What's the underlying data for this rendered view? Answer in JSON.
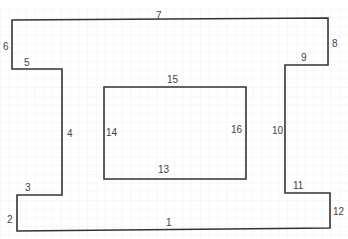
{
  "diagram": {
    "type": "floor-plan-outline",
    "outer_shape": {
      "description": "I-beam shaped outline with 12 numbered edges",
      "points": [
        [
          12,
          20
        ],
        [
          328,
          18
        ],
        [
          328,
          65
        ],
        [
          285,
          65
        ],
        [
          285,
          193
        ],
        [
          330,
          193
        ],
        [
          330,
          228
        ],
        [
          17,
          231
        ],
        [
          17,
          195
        ],
        [
          62,
          195
        ],
        [
          62,
          69
        ],
        [
          12,
          69
        ]
      ]
    },
    "inner_shape": {
      "description": "Rectangle with 4 numbered edges",
      "points": [
        [
          104,
          87
        ],
        [
          246,
          87
        ],
        [
          246,
          179
        ],
        [
          104,
          179
        ]
      ]
    },
    "line_color": "#333333",
    "grid_color": "#e4e4e4",
    "labels": [
      {
        "text": "1",
        "x": 166,
        "y": 218
      },
      {
        "text": "2",
        "x": 7,
        "y": 215
      },
      {
        "text": "3",
        "x": 25,
        "y": 183
      },
      {
        "text": "4",
        "x": 67,
        "y": 129
      },
      {
        "text": "5",
        "x": 24,
        "y": 58
      },
      {
        "text": "6",
        "x": 3,
        "y": 42
      },
      {
        "text": "7",
        "x": 156,
        "y": 11
      },
      {
        "text": "8",
        "x": 332,
        "y": 39
      },
      {
        "text": "9",
        "x": 301,
        "y": 53
      },
      {
        "text": "10",
        "x": 272,
        "y": 126
      },
      {
        "text": "11",
        "x": 293,
        "y": 181
      },
      {
        "text": "12",
        "x": 333,
        "y": 207
      },
      {
        "text": "13",
        "x": 158,
        "y": 165
      },
      {
        "text": "14",
        "x": 106,
        "y": 128
      },
      {
        "text": "15",
        "x": 167,
        "y": 75
      },
      {
        "text": "16",
        "x": 231,
        "y": 125
      }
    ]
  }
}
